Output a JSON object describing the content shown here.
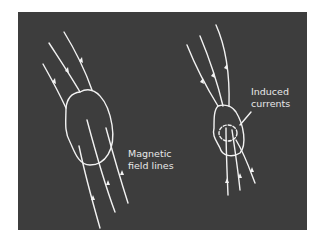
{
  "diagram": {
    "background_color": "#3d3d3d",
    "line_color": "#f2f2f2",
    "labels": {
      "magnetic_line1": "Magnetic",
      "magnetic_line2": "field lines",
      "induced_line1": "Induced",
      "induced_line2": "currents"
    },
    "objects": [
      {
        "name": "large-body",
        "description": "large oval body with magnetic field lines passing through"
      },
      {
        "name": "small-body",
        "description": "smaller oval body with dashed induced current loop"
      }
    ]
  }
}
